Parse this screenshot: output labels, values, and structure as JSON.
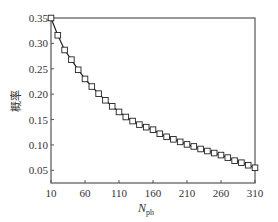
{
  "chart_data": {
    "type": "line",
    "title": "",
    "xlabel": "N",
    "xlabel_sub": "ph",
    "ylabel": "概率",
    "xlim": [
      10,
      310
    ],
    "ylim": [
      0.025,
      0.35
    ],
    "xticks": [
      10,
      60,
      110,
      160,
      210,
      260,
      310
    ],
    "yticks": [
      0.05,
      0.1,
      0.15,
      0.2,
      0.25,
      0.3,
      0.35
    ],
    "ytick_labels": [
      "0.05",
      "0.10",
      "0.15",
      "0.20",
      "0.25",
      "0.30",
      "0.35"
    ],
    "grid": false,
    "legend": null,
    "marker": "square-open",
    "series": [
      {
        "name": "probability",
        "x": [
          10,
          20,
          30,
          40,
          50,
          60,
          70,
          80,
          90,
          100,
          110,
          120,
          130,
          140,
          150,
          160,
          170,
          180,
          190,
          200,
          210,
          220,
          230,
          240,
          250,
          260,
          270,
          280,
          290,
          300,
          310
        ],
        "values": [
          0.35,
          0.316,
          0.287,
          0.268,
          0.248,
          0.23,
          0.215,
          0.201,
          0.188,
          0.176,
          0.165,
          0.155,
          0.147,
          0.14,
          0.135,
          0.13,
          0.122,
          0.116,
          0.111,
          0.106,
          0.101,
          0.097,
          0.092,
          0.088,
          0.084,
          0.08,
          0.075,
          0.069,
          0.065,
          0.06,
          0.055
        ]
      }
    ]
  }
}
